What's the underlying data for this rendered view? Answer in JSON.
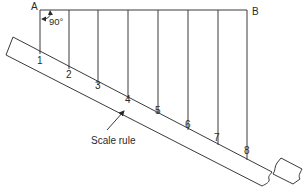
{
  "diagram": {
    "points": {
      "A": "A",
      "B": "B"
    },
    "angle_label": "90°",
    "ruler_label": "Scale rule",
    "divisions": [
      "1",
      "2",
      "3",
      "4",
      "5",
      "6",
      "7",
      "8"
    ],
    "colors": {
      "line": "#3a3a3a",
      "text": "#2a2a2a",
      "background": "#ffffff"
    }
  }
}
